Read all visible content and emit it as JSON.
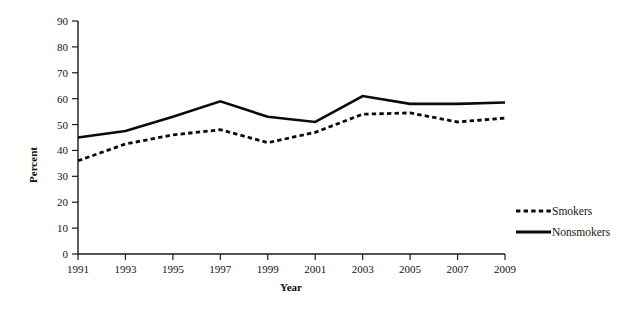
{
  "chart_data": {
    "type": "line",
    "title": "",
    "subtitle": "",
    "xlabel": "Year",
    "ylabel": "Percent",
    "x": [
      1991,
      1993,
      1995,
      1997,
      1999,
      2001,
      2003,
      2005,
      2007,
      2009
    ],
    "xtick_labels": [
      "1991",
      "1993",
      "1995",
      "1997",
      "1999",
      "2001",
      "2003",
      "2005",
      "2007",
      "2009"
    ],
    "ytick_labels": [
      "0",
      "10",
      "20",
      "30",
      "40",
      "50",
      "60",
      "70",
      "80",
      "90"
    ],
    "ytick_values": [
      0,
      10,
      20,
      30,
      40,
      50,
      60,
      70,
      80,
      90
    ],
    "xlim": [
      1991,
      2009
    ],
    "ylim": [
      0,
      90
    ],
    "grid": false,
    "legend_position": "right-center",
    "series": [
      {
        "name": "Smokers",
        "style": "dashed",
        "color": "#0b0b0b",
        "values": [
          36,
          42.5,
          46,
          48,
          43,
          47,
          54,
          54.5,
          51,
          52.5
        ]
      },
      {
        "name": "Nonsmokers",
        "style": "solid",
        "color": "#0b0b0b",
        "values": [
          45,
          47.5,
          53,
          59,
          53,
          51,
          61,
          58,
          58,
          58.5
        ]
      }
    ]
  },
  "legend": {
    "entries": [
      {
        "label": "Smokers"
      },
      {
        "label": "Nonsmokers"
      }
    ]
  },
  "axes": {
    "y_title": "Percent",
    "x_title": "Year"
  }
}
